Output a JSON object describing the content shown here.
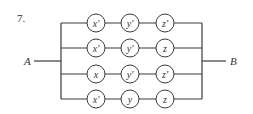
{
  "problem_number": "7.",
  "terminals": {
    "left": "A",
    "right": "B"
  },
  "rows": [
    {
      "switches": [
        "x'",
        "y'",
        "z'"
      ]
    },
    {
      "switches": [
        "x'",
        "y'",
        "z"
      ]
    },
    {
      "switches": [
        "x",
        "y'",
        "z'"
      ]
    },
    {
      "switches": [
        "x'",
        "y",
        "z"
      ]
    }
  ],
  "colors": {
    "line": "#3a3a3a",
    "text": "#333333",
    "background": "#ffffff"
  }
}
